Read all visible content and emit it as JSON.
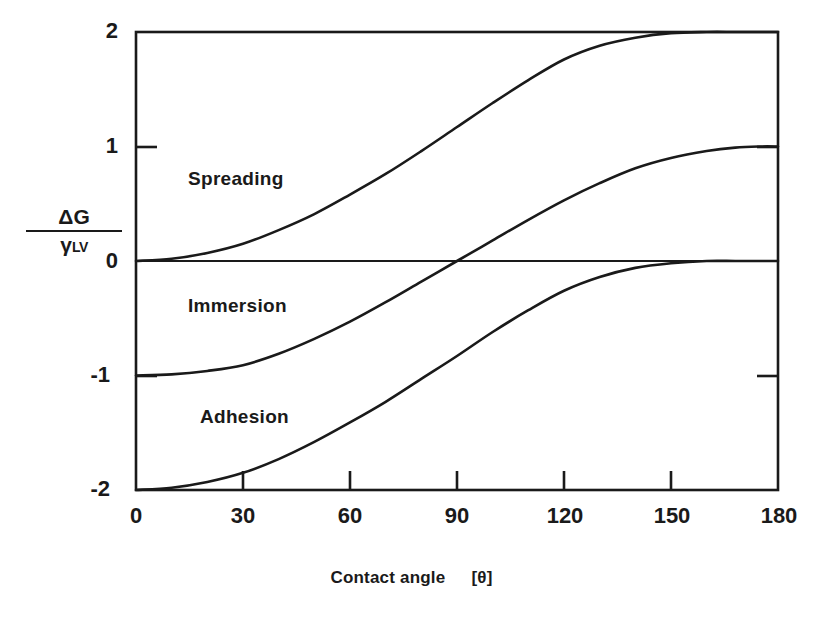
{
  "figure": {
    "title": "",
    "background": "#ffffff",
    "ink_color": "#1a1a1a"
  },
  "axes": {
    "y_label_numerator": "ΔG",
    "y_label_denominator": "γ",
    "y_label_denominator_sub": "LV",
    "x_title_main": "Contact angle",
    "x_title_unit": "[θ]",
    "y_ticks": [
      "2",
      "1",
      "0",
      "-1",
      "-2"
    ],
    "x_ticks": [
      "0",
      "30",
      "60",
      "90",
      "120",
      "150",
      "180"
    ]
  },
  "annotations": [
    {
      "label": "Spreading",
      "x_px": 188,
      "y_px": 168
    },
    {
      "label": "Immersion",
      "x_px": 188,
      "y_px": 295
    },
    {
      "label": "Adhesion",
      "x_px": 200,
      "y_px": 406
    }
  ],
  "chart_data": {
    "type": "line",
    "title": "",
    "xlabel": "Contact angle [θ]",
    "ylabel": "ΔG / γLV",
    "xlim": [
      0,
      180
    ],
    "ylim": [
      -2,
      2
    ],
    "xticks": [
      0,
      30,
      60,
      90,
      120,
      150,
      180
    ],
    "yticks": [
      -2,
      -1,
      0,
      1,
      2
    ],
    "grid": false,
    "legend": "inline-annotations",
    "x": [
      0,
      10,
      20,
      30,
      40,
      50,
      60,
      70,
      80,
      90,
      100,
      110,
      120,
      130,
      140,
      150,
      160,
      168,
      175,
      180
    ],
    "series": [
      {
        "name": "Spreading",
        "formula": "cos(theta) - 1",
        "values": [
          0.0,
          0.02,
          0.07,
          0.15,
          0.27,
          0.41,
          0.58,
          0.76,
          0.96,
          1.17,
          1.38,
          1.58,
          1.76,
          1.88,
          1.95,
          1.99,
          2.0,
          2.0,
          2.0,
          2.0
        ]
      },
      {
        "name": "Immersion",
        "formula": "cos(theta)",
        "values": [
          -1.0,
          -0.99,
          -0.96,
          -0.91,
          -0.81,
          -0.68,
          -0.53,
          -0.36,
          -0.18,
          0.0,
          0.18,
          0.36,
          0.53,
          0.68,
          0.81,
          0.9,
          0.96,
          0.99,
          1.0,
          1.0
        ]
      },
      {
        "name": "Adhesion",
        "formula": "cos(theta) + 1",
        "values": [
          -2.0,
          -1.98,
          -1.93,
          -1.85,
          -1.73,
          -1.58,
          -1.41,
          -1.23,
          -1.03,
          -0.83,
          -0.62,
          -0.43,
          -0.26,
          -0.14,
          -0.06,
          -0.02,
          0.0,
          0.0,
          0.0,
          0.0
        ]
      }
    ]
  }
}
